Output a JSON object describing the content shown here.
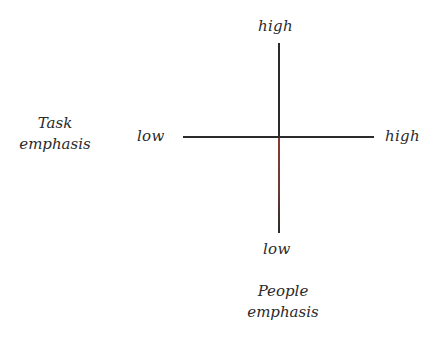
{
  "diagram": {
    "type": "two-axis quadrant diagram",
    "horizontal_axis": {
      "name": "Task emphasis",
      "label_line1": "Task",
      "label_line2": "emphasis",
      "low_label": "low",
      "high_label": "high"
    },
    "vertical_axis": {
      "name": "People emphasis",
      "label_line1": "People",
      "label_line2": "emphasis",
      "low_label": "low",
      "high_label": "high"
    },
    "colors": {
      "axis_line": "#2b2b2b",
      "text": "#2a2a2a",
      "background": "#ffffff"
    }
  }
}
